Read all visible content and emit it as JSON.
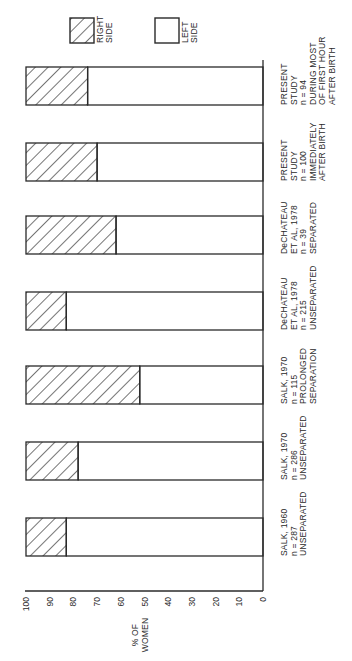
{
  "chart_data": {
    "type": "bar",
    "orientation": "stacked, rotated 90° (page reads bottom-to-top)",
    "title": "",
    "ylabel": "% OF WOMEN",
    "xlabel": "",
    "ylim": [
      0,
      100
    ],
    "yticks": [
      0,
      10,
      20,
      30,
      40,
      50,
      60,
      70,
      80,
      90,
      100
    ],
    "grid": false,
    "legend": [
      {
        "label": "RIGHT SIDE",
        "pattern": "hatched"
      },
      {
        "label": "LEFT SIDE",
        "pattern": "open"
      }
    ],
    "legend_position": "top",
    "categories": [
      [
        "SALK, 1960",
        "n = 287",
        "UNSEPARATED"
      ],
      [
        "SALK, 1970",
        "n = 286",
        "UNSEPARATED"
      ],
      [
        "SALK, 1970",
        "n = 115",
        "PROLONGED",
        "SEPARATION"
      ],
      [
        "DeCHATEAU",
        "ET AL, 1978",
        "n = 215",
        "UNSEPARATED"
      ],
      [
        "DeCHATEAU",
        "ET AL, 1978",
        "n = 39",
        "SEPARATED"
      ],
      [
        "PRESENT",
        "STUDY",
        "n = 100",
        "IMMEDIATELY",
        "AFTER BIRTH"
      ],
      [
        "PRESENT",
        "STUDY",
        "n = 94",
        "DURING MOST",
        "OF FIRST HOUR",
        "AFTER BIRTH"
      ]
    ],
    "series": [
      {
        "name": "LEFT SIDE",
        "values": [
          83,
          78,
          52,
          83,
          62,
          70,
          74
        ]
      },
      {
        "name": "RIGHT SIDE",
        "values": [
          17,
          22,
          48,
          17,
          38,
          30,
          26
        ]
      }
    ]
  },
  "colors": {
    "ink": "#2a2a2a",
    "background": "#ffffff"
  }
}
